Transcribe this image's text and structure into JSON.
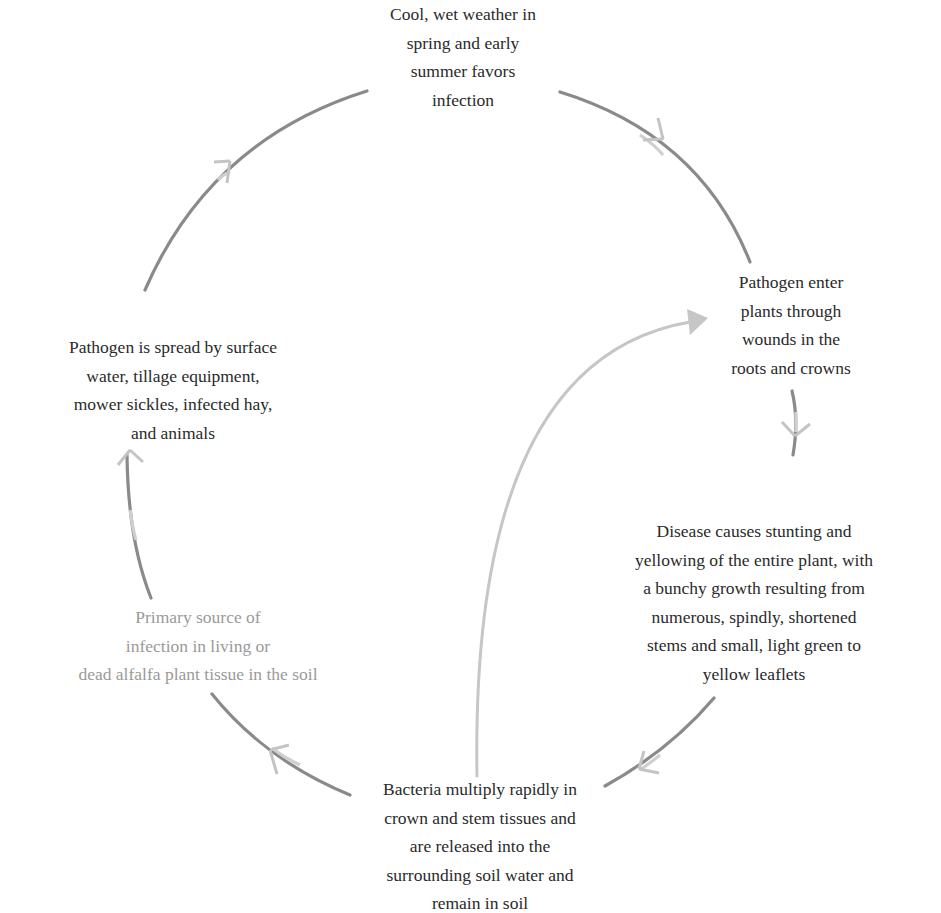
{
  "diagram": {
    "type": "cycle",
    "colors": {
      "text": "#2a2a2a",
      "faded_text": "#9a9a9a",
      "arrow_dark": "#7a7a7a",
      "arrow_light": "#c4c4c4"
    },
    "nodes": [
      {
        "id": "weather",
        "lines": [
          "Cool, wet weather in",
          "spring and early",
          "summer favors",
          "infection"
        ]
      },
      {
        "id": "entry",
        "lines": [
          "Pathogen enter",
          "plants through",
          "wounds in the",
          "roots and crowns"
        ]
      },
      {
        "id": "symptoms",
        "lines": [
          "Disease causes stunting and",
          "yellowing of the entire plant, with",
          "a bunchy growth resulting from",
          "numerous, spindly, shortened",
          "stems and small, light green to",
          "yellow leaflets"
        ]
      },
      {
        "id": "multiply",
        "lines": [
          "Bacteria multiply rapidly in",
          "crown and stem tissues and",
          "are released into the",
          "surrounding soil water and",
          "remain in soil"
        ]
      },
      {
        "id": "primary-source",
        "lines": [
          "Primary source of",
          "infection in living or",
          "dead alfalfa plant tissue in the soil"
        ]
      },
      {
        "id": "spread",
        "lines": [
          "Pathogen is spread by surface",
          "water, tillage equipment,",
          "mower sickles, infected hay,",
          "and animals"
        ]
      }
    ],
    "edges": [
      {
        "from": "weather",
        "to": "entry"
      },
      {
        "from": "entry",
        "to": "symptoms"
      },
      {
        "from": "symptoms",
        "to": "multiply"
      },
      {
        "from": "multiply",
        "to": "primary-source"
      },
      {
        "from": "primary-source",
        "to": "spread"
      },
      {
        "from": "spread",
        "to": "weather"
      },
      {
        "from": "multiply",
        "to": "entry",
        "style": "light-inner-arc"
      }
    ]
  }
}
